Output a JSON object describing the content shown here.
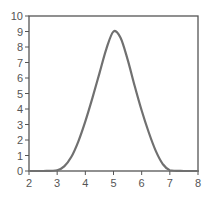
{
  "chart_data": {
    "type": "line",
    "title": "",
    "xlabel": "",
    "ylabel": "",
    "xlim": [
      2,
      8
    ],
    "ylim": [
      0,
      10
    ],
    "grid": false,
    "legend": null,
    "x_ticks": [
      "2",
      "3",
      "4",
      "5",
      "6",
      "7",
      "8"
    ],
    "y_ticks": [
      "0",
      "1",
      "2",
      "3",
      "4",
      "5",
      "6",
      "7",
      "8",
      "9",
      "10"
    ],
    "series": [
      {
        "name": "curve",
        "color": "#707070",
        "x": [
          2.0,
          2.5,
          3.0,
          3.25,
          3.5,
          3.75,
          4.0,
          4.25,
          4.5,
          4.75,
          5.0,
          5.25,
          5.5,
          5.75,
          6.0,
          6.25,
          6.5,
          6.75,
          7.0,
          7.5,
          8.0
        ],
        "values": [
          0.0,
          0.0,
          0.05,
          0.3,
          0.9,
          1.9,
          3.2,
          4.7,
          6.3,
          7.9,
          9.0,
          8.6,
          7.2,
          5.5,
          3.9,
          2.5,
          1.3,
          0.45,
          0.05,
          0.0,
          0.0
        ]
      }
    ]
  },
  "colors": {
    "axis": "#555555",
    "line": "#707070",
    "background": "#ffffff"
  }
}
